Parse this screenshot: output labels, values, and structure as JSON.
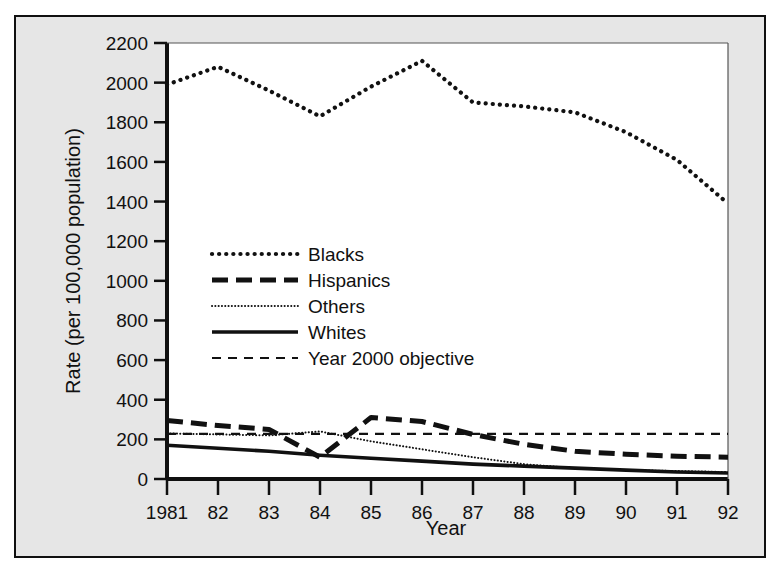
{
  "chart_data": {
    "type": "line",
    "title": "",
    "xlabel": "Year",
    "ylabel": "Rate (per 100,000 population)",
    "x": [
      1981,
      1982,
      1983,
      1984,
      1985,
      1986,
      1987,
      1988,
      1989,
      1990,
      1991,
      1992
    ],
    "xtick_labels": [
      "1981",
      "82",
      "83",
      "84",
      "85",
      "86",
      "87",
      "88",
      "89",
      "90",
      "91",
      "92"
    ],
    "ytick_labels": [
      "0",
      "200",
      "400",
      "600",
      "800",
      "1000",
      "1200",
      "1400",
      "1600",
      "1800",
      "2000",
      "2200"
    ],
    "ytick_values": [
      0,
      200,
      400,
      600,
      800,
      1000,
      1200,
      1400,
      1600,
      1800,
      2000,
      2200
    ],
    "xlim": [
      1981,
      1992
    ],
    "ylim": [
      0,
      2200
    ],
    "grid": false,
    "legend_position": "inside-left",
    "series": [
      {
        "name": "Blacks",
        "style": "dotted",
        "color": "#111111",
        "values": [
          1990,
          2080,
          1960,
          1830,
          1980,
          2110,
          1900,
          1880,
          1850,
          1750,
          1610,
          1390
        ]
      },
      {
        "name": "Hispanics",
        "style": "dash-dot",
        "color": "#111111",
        "values": [
          295,
          270,
          250,
          110,
          310,
          290,
          225,
          175,
          140,
          125,
          115,
          110
        ]
      },
      {
        "name": "Others",
        "style": "fine-dotted",
        "color": "#111111",
        "values": [
          230,
          225,
          220,
          240,
          190,
          150,
          110,
          75,
          55,
          45,
          40,
          35
        ]
      },
      {
        "name": "Whites",
        "style": "solid",
        "color": "#111111",
        "values": [
          170,
          155,
          140,
          120,
          105,
          90,
          75,
          65,
          55,
          45,
          35,
          30
        ]
      },
      {
        "name": "Year 2000 objective",
        "style": "dashed",
        "color": "#111111",
        "values": [
          228,
          228,
          228,
          228,
          228,
          228,
          228,
          228,
          228,
          228,
          228,
          228
        ]
      }
    ]
  },
  "legend": {
    "entries": [
      {
        "label": "Blacks"
      },
      {
        "label": "Hispanics"
      },
      {
        "label": "Others"
      },
      {
        "label": "Whites"
      },
      {
        "label": "Year 2000 objective"
      }
    ]
  },
  "colors": {
    "figure_background": "#e6e6e6",
    "plot_background": "#ffffff",
    "axis": "#101010",
    "line": "#111111"
  }
}
